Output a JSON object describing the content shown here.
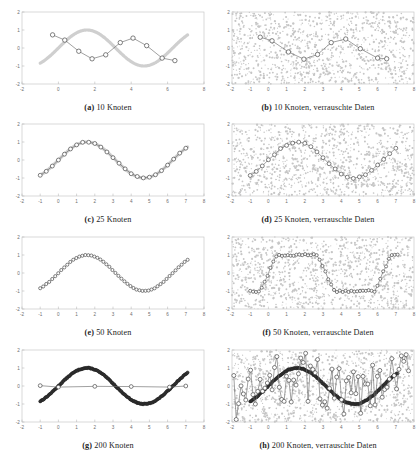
{
  "figure": {
    "panels": [
      {
        "id": "a",
        "label": "(a)",
        "text": "10 Knoten",
        "caption": "10 Knoten",
        "noisy": false,
        "knots": 10
      },
      {
        "id": "b",
        "label": "(b)",
        "text": "10 Knoten, verrauschte Daten",
        "caption": "10 Knoten, verrauschte Daten",
        "noisy": true,
        "knots": 10
      },
      {
        "id": "c",
        "label": "(c)",
        "text": "25 Knoten",
        "caption": "25 Knoten",
        "noisy": false,
        "knots": 25
      },
      {
        "id": "d",
        "label": "(d)",
        "text": "25 Knoten, verrauschte Daten",
        "caption": "25 Knoten, verrauschte Daten",
        "noisy": true,
        "knots": 25
      },
      {
        "id": "e",
        "label": "(e)",
        "text": "50 Knoten",
        "caption": "50 Knoten",
        "noisy": false,
        "knots": 50
      },
      {
        "id": "f",
        "label": "(f)",
        "text": "50 Knoten, verrauschte Daten",
        "caption": "50 Knoten, verrauschte Daten",
        "noisy": true,
        "knots": 50
      },
      {
        "id": "g",
        "label": "(g)",
        "text": "200 Knoten",
        "caption": "200 Knoten",
        "noisy": false,
        "knots": 200
      },
      {
        "id": "h",
        "label": "(h)",
        "text": "200 Knoten, verrauschte Daten",
        "caption": "200 Knoten, verrauschte Daten",
        "noisy": true,
        "knots": 200
      }
    ]
  },
  "colors": {
    "true_curve": "#cfcfcf",
    "fit_line": "#6e6e6e",
    "knot_fill": "#ffffff",
    "knot_stroke": "#4a4a4a",
    "dense_knot": "#3a3a3a",
    "noise_points": "#c6c6c6",
    "frame": "#c8c8c8",
    "tick_text": "#6d6d6d"
  },
  "chart_data": [
    {
      "type": "scatter",
      "id": "a",
      "title": "(a) 10 Knoten",
      "xlabel": "",
      "ylabel": "",
      "xlim": [
        -2,
        8
      ],
      "ylim": [
        -2,
        2
      ],
      "xticks": [
        -2,
        0,
        2,
        4,
        6,
        8
      ],
      "xticklabels": [
        "-2",
        "0",
        "2",
        "4",
        "6",
        "8"
      ],
      "yticks": [
        -2,
        -1,
        0,
        1,
        2
      ],
      "yticklabels": [
        "-2",
        "-1",
        "0",
        "1",
        "2"
      ],
      "grid": false,
      "legend": null,
      "series": [
        {
          "name": "wahre Funktion sin(x)",
          "type": "line",
          "style": "thick-light-gray",
          "x": [
            -1.0,
            -0.5,
            0.0,
            0.5,
            1.0,
            1.5,
            2.0,
            2.5,
            3.0,
            3.5,
            4.0,
            4.5,
            5.0,
            5.5,
            6.0,
            6.5,
            7.0
          ],
          "y": [
            -0.84,
            -0.48,
            0.0,
            0.48,
            0.84,
            1.0,
            0.91,
            0.6,
            0.14,
            -0.35,
            -0.76,
            -0.98,
            -0.96,
            -0.71,
            -0.28,
            0.22,
            0.66
          ]
        },
        {
          "name": "Spline-Fit (10 Knoten)",
          "type": "line+markers",
          "style": "dark-line-open-circles",
          "x": [
            -0.32,
            0.35,
            1.12,
            1.85,
            2.6,
            3.4,
            4.1,
            4.85,
            5.7,
            6.4
          ],
          "y": [
            0.73,
            0.44,
            -0.18,
            -0.6,
            -0.38,
            0.3,
            0.55,
            0.13,
            -0.56,
            -0.7
          ]
        }
      ]
    },
    {
      "type": "scatter",
      "id": "b",
      "title": "(b) 10 Knoten, verrauschte Daten",
      "xlim": [
        -2,
        8
      ],
      "ylim": [
        -2,
        2
      ],
      "xticks": [
        -2,
        -1,
        0,
        1,
        2,
        3,
        4,
        5,
        6,
        7,
        8
      ],
      "xticklabels": [
        "-2",
        "-1",
        "0",
        "1",
        "2",
        "3",
        "4",
        "5",
        "6",
        "7",
        "8"
      ],
      "yticks": [
        -2,
        -1,
        0,
        1,
        2
      ],
      "yticklabels": [
        "-2",
        "-1",
        "0",
        "1",
        "2"
      ],
      "grid": false,
      "noise_cloud": {
        "n": 900,
        "xrange": [
          -2,
          8
        ],
        "yrange": [
          -2,
          2
        ],
        "color": "#c6c6c6"
      },
      "series": [
        {
          "name": "Spline-Fit (10 Knoten)",
          "type": "line+markers",
          "style": "dark-line-open-circles",
          "x": [
            -0.45,
            0.2,
            1.1,
            1.95,
            2.7,
            3.45,
            4.25,
            5.05,
            6.0,
            6.5
          ],
          "y": [
            0.6,
            0.4,
            -0.22,
            -0.62,
            -0.36,
            0.3,
            0.5,
            -0.04,
            -0.56,
            -0.6
          ]
        }
      ]
    },
    {
      "type": "scatter",
      "id": "c",
      "title": "(c) 25 Knoten",
      "xlim": [
        -2,
        8
      ],
      "ylim": [
        -2,
        2
      ],
      "xticks": [
        -2,
        -1,
        0,
        1,
        2,
        3,
        4,
        5,
        6,
        7,
        8
      ],
      "xticklabels": [
        "-2",
        "-1",
        "0",
        "1",
        "2",
        "3",
        "4",
        "5",
        "6",
        "7",
        "8"
      ],
      "yticks": [
        -2,
        -1,
        0,
        1,
        2
      ],
      "yticklabels": [
        "-2",
        "-1",
        "0",
        "1",
        "2"
      ],
      "grid": false,
      "series": [
        {
          "name": "wahre Funktion sin(x)",
          "type": "line",
          "style": "thick-light-gray"
        },
        {
          "name": "Spline-Fit (25 Knoten)",
          "type": "line+markers",
          "style": "dark-line-open-circles",
          "n_markers": 25
        }
      ]
    },
    {
      "type": "scatter",
      "id": "d",
      "title": "(d) 25 Knoten, verrauschte Daten",
      "xlim": [
        -2,
        8
      ],
      "ylim": [
        -2,
        2
      ],
      "xticks": [
        -2,
        -1,
        0,
        1,
        2,
        3,
        4,
        5,
        6,
        7,
        8
      ],
      "yticks": [
        -2,
        -1,
        0,
        1,
        2
      ],
      "grid": false,
      "noise_cloud": {
        "n": 900,
        "color": "#c6c6c6"
      },
      "series": [
        {
          "name": "Spline-Fit (25 Knoten)",
          "type": "line+markers",
          "style": "dark-line-open-circles",
          "n_markers": 25
        }
      ]
    },
    {
      "type": "scatter",
      "id": "e",
      "title": "(e) 50 Knoten",
      "xlim": [
        -2,
        8
      ],
      "ylim": [
        -2,
        2
      ],
      "xticks": [
        -2,
        -1,
        0,
        1,
        2,
        3,
        4,
        5,
        6,
        7,
        8
      ],
      "yticks": [
        -2,
        -1,
        0,
        1,
        2
      ],
      "grid": false,
      "series": [
        {
          "name": "Spline-Fit (50 Knoten)",
          "type": "line+markers",
          "style": "dark-line-open-circles",
          "n_markers": 50
        }
      ]
    },
    {
      "type": "scatter",
      "id": "f",
      "title": "(f) 50 Knoten, verrauschte Daten",
      "xlim": [
        -2,
        8
      ],
      "ylim": [
        -2,
        2
      ],
      "xticks": [
        -2,
        -1,
        0,
        1,
        2,
        3,
        4,
        5,
        6,
        7,
        8
      ],
      "yticks": [
        -2,
        -1,
        0,
        1,
        2
      ],
      "grid": false,
      "noise_cloud": {
        "n": 900,
        "color": "#c6c6c6"
      },
      "series": [
        {
          "name": "Spline-Fit (50 Knoten), uberangepasst",
          "type": "line+markers",
          "style": "square-wave-open-circles",
          "n_markers": 50
        }
      ]
    },
    {
      "type": "scatter",
      "id": "g",
      "title": "(g) 200 Knoten",
      "xlim": [
        -2,
        8
      ],
      "ylim": [
        -2,
        2
      ],
      "xticks": [
        -2,
        -1,
        0,
        1,
        2,
        3,
        4,
        5,
        6,
        7,
        8
      ],
      "yticks": [
        -2,
        -1,
        0,
        1,
        2
      ],
      "grid": false,
      "series": [
        {
          "name": "Spline-Fit (200 Knoten)",
          "type": "markers",
          "style": "dense-dark-circles",
          "n_markers": 200
        },
        {
          "name": "Stutzstellen y=0",
          "type": "line+markers",
          "style": "dark-line-open-circles",
          "x": [
            -1.0,
            0.0,
            2.0,
            4.0,
            6.1,
            7.0
          ],
          "y": [
            0.02,
            -0.06,
            -0.02,
            -0.03,
            -0.06,
            0.0
          ]
        }
      ]
    },
    {
      "type": "scatter",
      "id": "h",
      "title": "(h) 200 Knoten, verrauschte Daten",
      "xlim": [
        -2,
        8
      ],
      "ylim": [
        -2,
        2
      ],
      "xticks": [
        -2,
        -1,
        0,
        1,
        2,
        3,
        4,
        5,
        6,
        7,
        8
      ],
      "yticks": [
        -2,
        -1,
        0,
        1,
        2
      ],
      "grid": false,
      "noise_cloud": {
        "n": 900,
        "color": "#c6c6c6"
      },
      "series": [
        {
          "name": "Spline-Fit (200 Knoten)",
          "type": "markers",
          "style": "dense-dark-circles",
          "n_markers": 200
        },
        {
          "name": "Uberanpassung, erratische Knoten",
          "type": "line+markers",
          "style": "erratic-open-circles",
          "n_markers": 70
        }
      ]
    }
  ]
}
